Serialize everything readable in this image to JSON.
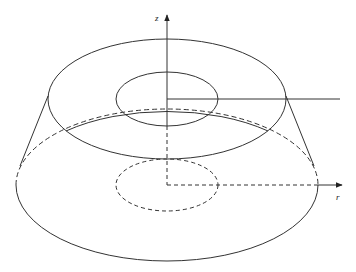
{
  "diagram": {
    "type": "3d-annular-frustum",
    "axis_labels": {
      "vertical": "z",
      "horizontal": "r"
    },
    "colors": {
      "stroke": "#333333",
      "background": "#ffffff"
    }
  }
}
